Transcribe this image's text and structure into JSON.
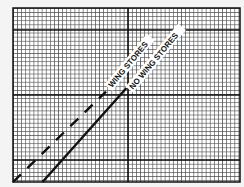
{
  "chart_data": {
    "type": "line",
    "title": "",
    "xlabel": "",
    "ylabel": "",
    "grid": true,
    "legend_position": "inline-annotation",
    "xlim": [
      0,
      1
    ],
    "ylim": [
      0,
      1
    ],
    "series": [
      {
        "name": "WING STORES",
        "style": "dashed",
        "x": [
          0.0,
          0.41
        ],
        "y": [
          0.0,
          0.52
        ]
      },
      {
        "name": "NO WING STORES",
        "style": "solid",
        "x": [
          0.13,
          0.5
        ],
        "y": [
          0.0,
          0.54
        ]
      }
    ],
    "annotations": [
      {
        "text": "WING STORES",
        "rotation": -50
      },
      {
        "text": "NO WING STORES",
        "rotation": -50
      }
    ]
  },
  "colors": {
    "background": "#f4f4f4",
    "plot_background": "#ffffff",
    "grid_minor": "#4a4a4a",
    "grid_major": "#111111",
    "line": "#111111"
  },
  "labels": {
    "wing_stores": "WING STORES",
    "no_wing_stores": "NO WING STORES"
  }
}
